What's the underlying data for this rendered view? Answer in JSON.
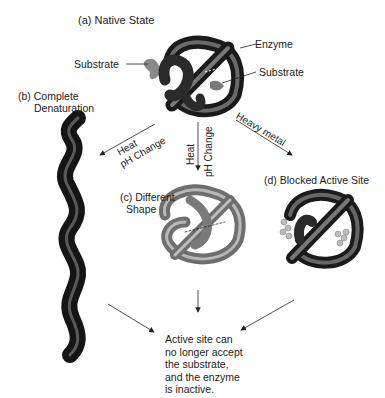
{
  "labels": {
    "native_state": "(a) Native State",
    "enzyme": "Enzyme",
    "substrate_left": "Substrate",
    "substrate_right": "Substrate",
    "complete_denaturation_1": "(b) Complete",
    "complete_denaturation_2": "Denaturation",
    "different_shape_1": "(c) Different",
    "different_shape_2": "Shape",
    "blocked_active_site": "(d) Blocked Active Site"
  },
  "arrows": {
    "left_line1": "Heat",
    "left_line2": "pH Change",
    "middle_line1": "Heat",
    "middle_line2": "pH Change",
    "right": "Heavy metal"
  },
  "conclusion": [
    "Active site can",
    "no longer accept",
    "the substrate,",
    "and the enzyme",
    "is inactive."
  ]
}
